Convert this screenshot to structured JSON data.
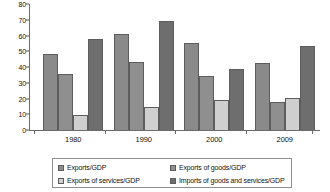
{
  "chart_data": {
    "type": "bar",
    "title": "",
    "xlabel": "",
    "ylabel": "",
    "ylim": [
      0,
      80
    ],
    "yticks": [
      0,
      10,
      20,
      30,
      40,
      50,
      60,
      70,
      80
    ],
    "grid": false,
    "legend_position": "bottom",
    "categories": [
      "1980",
      "1990",
      "2000",
      "2009"
    ],
    "series": [
      {
        "name": "Exports/GDP",
        "color": "#8a8a8a",
        "values": [
          48,
          61,
          55,
          42.5
        ]
      },
      {
        "name": "Exports of goods/GDP",
        "color": "#8f8f8f",
        "values": [
          35.5,
          43.5,
          34,
          18
        ]
      },
      {
        "name": "Exports of services/GDP",
        "color": "#cfcfcf",
        "values": [
          9.5,
          14.5,
          19,
          20.5
        ]
      },
      {
        "name": "Imports of goods and services/GDP",
        "color": "#6e6e6e",
        "values": [
          58,
          69.5,
          39,
          53.5
        ]
      }
    ]
  },
  "legend": {
    "items": [
      {
        "label": "Exports/GDP",
        "color": "#8a8a8a"
      },
      {
        "label": "Exports of goods/GDP",
        "color": "#8f8f8f"
      },
      {
        "label": "Exports of services/GDP",
        "color": "#cfcfcf"
      },
      {
        "label": "Imports of goods and services/GDP",
        "color": "#6e6e6e"
      }
    ]
  }
}
